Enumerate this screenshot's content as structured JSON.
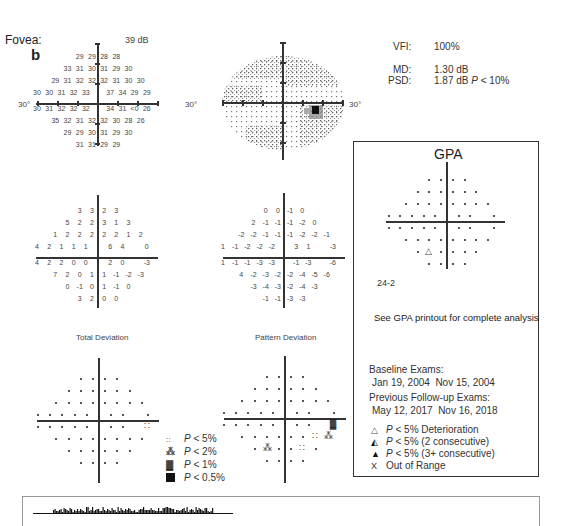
{
  "header": {
    "fovea_label": "Fovea:",
    "fovea_value": "39 dB",
    "panel_letter": "b",
    "axis_left_label": "30°",
    "axis_right_label": "30°",
    "axis_gray_right_label": "30°"
  },
  "indices": {
    "vfi_label": "VFI:",
    "vfi_value": "100%",
    "md_label": "MD:",
    "md_value": "1.30 dB",
    "psd_label": "PSD:",
    "psd_value": "1.87 dB",
    "psd_p_prefix": "P",
    "psd_p_value": "< 10%"
  },
  "threshold_rows": [
    [
      "29",
      "29",
      "28",
      "28"
    ],
    [
      "33",
      "31",
      "30",
      "31",
      "29",
      "30"
    ],
    [
      "29",
      "31",
      "32",
      "32",
      "32",
      "31",
      "30",
      "30"
    ],
    [
      "30",
      "30",
      "31",
      "32",
      "33",
      "37",
      "34",
      "29",
      "29"
    ],
    [
      "30",
      "31",
      "32",
      "32",
      "32",
      "34",
      "31",
      "<0",
      "26"
    ],
    [
      "35",
      "32",
      "31",
      "32",
      "32",
      "30",
      "28",
      "26"
    ],
    [
      "29",
      "29",
      "30",
      "31",
      "29",
      "30"
    ],
    [
      "31",
      "31",
      "29",
      "29"
    ]
  ],
  "total_deviation_rows": [
    [
      "3",
      "3",
      "2",
      "3"
    ],
    [
      "5",
      "2",
      "2",
      "3",
      "1",
      "3"
    ],
    [
      "1",
      "2",
      "2",
      "2",
      "2",
      "2",
      "1",
      "2"
    ],
    [
      "4",
      "2",
      "1",
      "1",
      "1",
      "6",
      "4",
      "",
      "0"
    ],
    [
      "4",
      "2",
      "2",
      "0",
      "0",
      "2",
      "0",
      "",
      "-3"
    ],
    [
      "7",
      "2",
      "0",
      "1",
      "1",
      "-1",
      "-2",
      "-3"
    ],
    [
      "0",
      "-1",
      "0",
      "1",
      "-1",
      "0"
    ],
    [
      "3",
      "2",
      "0",
      "0"
    ]
  ],
  "pattern_deviation_rows": [
    [
      "0",
      "0",
      "-1",
      "0"
    ],
    [
      "2",
      "-1",
      "-1",
      "-1",
      "-2",
      "0"
    ],
    [
      "-2",
      "-2",
      "-1",
      "-1",
      "-1",
      "-2",
      "-2",
      "-1"
    ],
    [
      "1",
      "-1",
      "-2",
      "-2",
      "-2",
      "3",
      "1",
      "",
      "-3"
    ],
    [
      "1",
      "-1",
      "-1",
      "-3",
      "-3",
      "-1",
      "-3",
      "",
      "-6"
    ],
    [
      "4",
      "-2",
      "-3",
      "-2",
      "-2",
      "-4",
      "-5",
      "-6"
    ],
    [
      "-3",
      "-4",
      "-3",
      "-2",
      "-4",
      "-3"
    ],
    [
      "-1",
      "-1",
      "-3",
      "-3"
    ]
  ],
  "probability_plots": {
    "total_deviation_title": "Total Deviation",
    "pattern_deviation_title": "Pattern Deviation"
  },
  "probability_legend": [
    {
      "symbol": "::",
      "prefix": "P",
      "text": "< 5%"
    },
    {
      "symbol": "⸬",
      "prefix": "P",
      "text": "< 2%"
    },
    {
      "symbol": "▓",
      "prefix": "P",
      "text": "< 1%"
    },
    {
      "symbol": "■",
      "prefix": "P",
      "text": "< 0.5%"
    }
  ],
  "gpa": {
    "title": "GPA",
    "pattern_label": "24-2",
    "note": "See GPA printout for complete analysis",
    "baseline_label": "Baseline Exams:",
    "baseline_dates": "Jan 19, 2004  Nov 15, 2004",
    "followup_label": "Previous Follow-up Exams:",
    "followup_dates": "May 12, 2017  Nov 16, 2018",
    "legend": [
      {
        "symbol": "△",
        "prefix": "P",
        "text": "< 5% Deterioration"
      },
      {
        "symbol": "◭",
        "prefix": "P",
        "text": "< 5% (2 consecutive)"
      },
      {
        "symbol": "▲",
        "prefix": "P",
        "text": "< 5% (3+ consecutive)"
      },
      {
        "symbol": "X",
        "prefix": "",
        "text": "Out of Range"
      }
    ]
  }
}
